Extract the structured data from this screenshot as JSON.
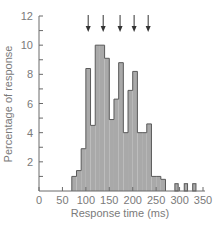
{
  "chart_data": {
    "type": "bar",
    "title": "",
    "xlabel": "Response time (ms)",
    "ylabel": "Percentage of response",
    "xlim": [
      0,
      350
    ],
    "ylim": [
      0,
      12
    ],
    "xticks": [
      0,
      50,
      100,
      150,
      200,
      250,
      300,
      350
    ],
    "yticks": [
      2,
      4,
      6,
      8,
      10,
      12
    ],
    "grid": false,
    "bin_width_ms": 10,
    "bins": [
      {
        "start": 70,
        "end": 80,
        "value": 1.0
      },
      {
        "start": 80,
        "end": 90,
        "value": 1.4
      },
      {
        "start": 90,
        "end": 100,
        "value": 2.9
      },
      {
        "start": 100,
        "end": 110,
        "value": 8.4
      },
      {
        "start": 110,
        "end": 120,
        "value": 4.5
      },
      {
        "start": 120,
        "end": 130,
        "value": 10.0
      },
      {
        "start": 130,
        "end": 140,
        "value": 10.0
      },
      {
        "start": 140,
        "end": 150,
        "value": 9.1
      },
      {
        "start": 150,
        "end": 160,
        "value": 4.9
      },
      {
        "start": 160,
        "end": 170,
        "value": 6.3
      },
      {
        "start": 170,
        "end": 180,
        "value": 8.8
      },
      {
        "start": 180,
        "end": 190,
        "value": 4.0
      },
      {
        "start": 190,
        "end": 200,
        "value": 6.9
      },
      {
        "start": 200,
        "end": 210,
        "value": 8.2
      },
      {
        "start": 210,
        "end": 220,
        "value": 4.0
      },
      {
        "start": 220,
        "end": 230,
        "value": 4.0
      },
      {
        "start": 230,
        "end": 240,
        "value": 4.6
      },
      {
        "start": 240,
        "end": 250,
        "value": 1.0
      },
      {
        "start": 250,
        "end": 260,
        "value": 1.0
      },
      {
        "start": 260,
        "end": 270,
        "value": 0.8
      },
      {
        "start": 290,
        "end": 297,
        "value": 0.5
      },
      {
        "start": 310,
        "end": 317,
        "value": 0.5
      },
      {
        "start": 328,
        "end": 335,
        "value": 0.5
      }
    ],
    "annotations": {
      "arrows_at_ms": [
        105,
        137,
        173,
        203,
        233
      ],
      "description": "downward arrows above histogram peaks"
    },
    "colors": {
      "bar_fill": "#a9a9a9",
      "bar_edge": "#5a5a5a",
      "axis": "#6a6a6a",
      "text": "#7a7a7a"
    }
  }
}
